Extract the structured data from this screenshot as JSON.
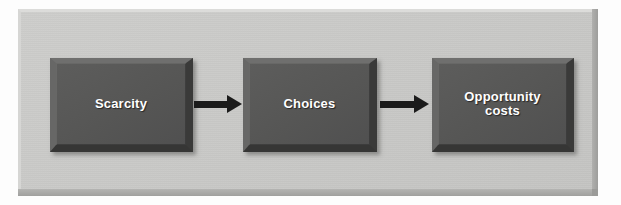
{
  "diagram": {
    "type": "flowchart",
    "orientation": "left-to-right",
    "title": "",
    "panel": {
      "background_color": "#c9c9c7",
      "style": "raised-3d-bevel"
    },
    "node_style": {
      "fill_color": "#575756",
      "text_color": "#ffffff",
      "style": "beveled-3d-rectangle"
    },
    "connector_style": {
      "color": "#1b1b1b",
      "shape": "solid-arrow"
    },
    "nodes": [
      {
        "id": "scarcity",
        "label": "Scarcity"
      },
      {
        "id": "choices",
        "label": "Choices"
      },
      {
        "id": "opportunity-costs",
        "label": "Opportunity\ncosts"
      }
    ],
    "edges": [
      {
        "id": "edge-1",
        "from": "scarcity",
        "to": "choices",
        "label": ""
      },
      {
        "id": "edge-2",
        "from": "choices",
        "to": "opportunity-costs",
        "label": ""
      }
    ]
  }
}
